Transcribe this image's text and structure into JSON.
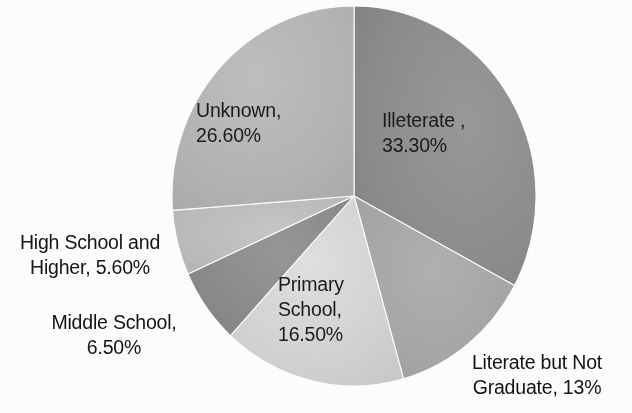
{
  "chart_data": {
    "type": "pie",
    "title": "",
    "subtitle": "",
    "xlabel": "",
    "ylabel": "",
    "legend_position": "none",
    "grid": false,
    "label_format": "category, percent",
    "start_angle_deg": 0,
    "direction": "clockwise",
    "categories": [
      "Illeterate ",
      "Literate but Not Graduate",
      "Primary School",
      "Middle School",
      "High School and Higher",
      "Unknown"
    ],
    "values": [
      33.3,
      13,
      16.5,
      6.5,
      5.6,
      26.6
    ],
    "value_labels": [
      "33.30%",
      "13%",
      "16.50%",
      "6.50%",
      "5.60%",
      "26.60%"
    ],
    "slices": [
      {
        "name": "Illeterate ",
        "value": 33.3,
        "value_label": "33.30%",
        "label_text": "Illeterate ,\n33.30%",
        "color": "#8d8d8d",
        "color_light": "#a0a0a0",
        "label_placement": "inside"
      },
      {
        "name": "Literate but Not Graduate",
        "value": 13,
        "value_label": "13%",
        "label_text": "Literate but Not\nGraduate, 13%",
        "color": "#a6a6a6",
        "color_light": "#b6b6b6",
        "label_placement": "outside"
      },
      {
        "name": "Primary School",
        "value": 16.5,
        "value_label": "16.50%",
        "label_text": "Primary\nSchool,\n16.50%",
        "color": "#d2d2d2",
        "color_light": "#e0e0e0",
        "label_placement": "inside"
      },
      {
        "name": "Middle School",
        "value": 6.5,
        "value_label": "6.50%",
        "label_text": "Middle School,\n6.50%",
        "color": "#8b8b8b",
        "color_light": "#9c9c9c",
        "label_placement": "outside"
      },
      {
        "name": "High School and Higher",
        "value": 5.6,
        "value_label": "5.60%",
        "label_text": "High School and\nHigher, 5.60%",
        "color": "#bcbcbc",
        "color_light": "#cacaca",
        "label_placement": "outside"
      },
      {
        "name": "Unknown",
        "value": 26.6,
        "value_label": "26.60%",
        "label_text": "Unknown,\n26.60%",
        "color": "#b4b4b4",
        "color_light": "#c2c2c2",
        "label_placement": "inside"
      }
    ],
    "total": 101.5,
    "units": "percent"
  },
  "figure": {
    "background_color": "#ffffff",
    "text_color": "#1b1b1b",
    "center_x": 354,
    "center_y": 196,
    "radius_x": 182,
    "radius_y": 190
  }
}
